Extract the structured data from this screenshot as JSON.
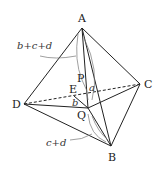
{
  "diagram": {
    "type": "tetrahedron",
    "vertices": [
      {
        "name": "A",
        "x": 82,
        "y": 28
      },
      {
        "name": "B",
        "x": 111,
        "y": 146
      },
      {
        "name": "C",
        "x": 140,
        "y": 84
      },
      {
        "name": "D",
        "x": 24,
        "y": 104
      }
    ],
    "interior_points": [
      {
        "name": "P",
        "x": 88,
        "y": 86
      },
      {
        "name": "Q",
        "x": 88,
        "y": 108
      },
      {
        "name": "E",
        "x": 77,
        "y": 92
      }
    ],
    "labels": {
      "A": "A",
      "B": "B",
      "C": "C",
      "D": "D",
      "P": "P",
      "Q": "Q",
      "E": "E",
      "a": "a",
      "b": "b",
      "bcd": "b+c+d",
      "cd": "c+d"
    },
    "colors": {
      "line": "#222222",
      "arc": "#777777"
    }
  }
}
